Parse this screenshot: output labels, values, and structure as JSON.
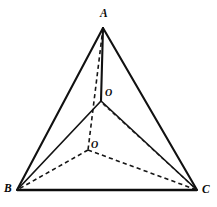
{
  "figure": {
    "kind": "geometry-diagram",
    "width": 217,
    "height": 207,
    "background_color": "#ffffff",
    "stroke_color": "#111111"
  },
  "labels": {
    "apex": "A",
    "base_left": "B",
    "base_right": "C",
    "center_upper": "O",
    "center_lower": "O"
  },
  "points": {
    "A": {
      "label": "A",
      "x": 103,
      "y": 28,
      "label_x": 100,
      "label_y": 8
    },
    "B": {
      "label": "B",
      "x": 17,
      "y": 190,
      "label_x": 4,
      "label_y": 183
    },
    "C": {
      "label": "C",
      "x": 197,
      "y": 190,
      "label_x": 202,
      "label_y": 184
    },
    "O_upper": {
      "label": "O",
      "x": 101,
      "y": 100,
      "label_x": 105,
      "label_y": 88
    },
    "O_lower": {
      "label": "O",
      "x": 88,
      "y": 150,
      "label_x": 91,
      "label_y": 140
    }
  },
  "edges": [
    {
      "name": "edge-A-B",
      "from": "A",
      "to": "B",
      "style": "solid",
      "hidden": false
    },
    {
      "name": "edge-A-C",
      "from": "A",
      "to": "C",
      "style": "solid",
      "hidden": false
    },
    {
      "name": "edge-B-C",
      "from": "B",
      "to": "C",
      "style": "solid-base",
      "hidden": false
    },
    {
      "name": "edge-A-Oupper",
      "from": "A",
      "to": "O_upper",
      "style": "solid",
      "hidden": false
    },
    {
      "name": "edge-Oupper-B",
      "from": "O_upper",
      "to": "B",
      "style": "solid-thin",
      "hidden": false
    },
    {
      "name": "edge-Oupper-C",
      "from": "O_upper",
      "to": "C",
      "style": "solid-thin",
      "hidden": false
    },
    {
      "name": "edge-A-Olower",
      "from": "A",
      "to": "O_lower",
      "style": "dashed",
      "hidden": true
    },
    {
      "name": "edge-Olower-B",
      "from": "O_lower",
      "to": "B",
      "style": "dashed",
      "hidden": true
    },
    {
      "name": "edge-Olower-C",
      "from": "O_lower",
      "to": "C",
      "style": "dashed",
      "hidden": true
    },
    {
      "name": "edge-Oupper-C-faint",
      "from": "O_upper",
      "to": "C",
      "style": "dashed-faint",
      "hidden": true
    }
  ]
}
